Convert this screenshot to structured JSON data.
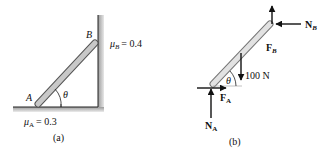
{
  "figure_a": {
    "caption": "(a)",
    "point_a_label": "A",
    "point_b_label": "B",
    "angle_label": "θ",
    "mu_a": {
      "symbol": "μ",
      "subscript": "A",
      "value": "= 0.3"
    },
    "mu_b": {
      "symbol": "μ",
      "subscript": "B",
      "value": "= 0.4"
    }
  },
  "figure_b": {
    "caption": "(b)",
    "angle_label": "θ",
    "weight_label": "100 N",
    "forces": {
      "f_b": {
        "symbol": "F",
        "subscript": "B"
      },
      "n_b": {
        "symbol": "N",
        "subscript": "B"
      },
      "f_a": {
        "symbol": "F",
        "subscript": "A"
      },
      "n_a": {
        "symbol": "N",
        "subscript": "A"
      }
    }
  },
  "colors": {
    "bar_fill": "#c8c8c8",
    "bar_stroke": "#555555",
    "wall_shade": "#a8a8a8",
    "arrow": "#111111"
  }
}
